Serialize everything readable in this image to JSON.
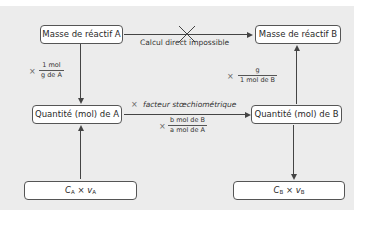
{
  "boxes": {
    "mass_a": "Masse de réactif A",
    "mass_b": "Masse de réactif B",
    "qty_a": "Quantité (mol) de A",
    "qty_b": "Quantité (mol) de B",
    "conc_a": {
      "c": "C",
      "c_sub": "A",
      "op": " × ",
      "v": "v",
      "v_sub": "A"
    },
    "conc_b": {
      "c": "C",
      "c_sub": "B",
      "op": " × ",
      "v": "v",
      "v_sub": "B"
    }
  },
  "labels": {
    "direct": "Calcul direct impossible",
    "times": "×",
    "factor": "facteur stœchiométrique",
    "frac_a_num": "1 mol",
    "frac_a_den": "g de A",
    "frac_b_num": "g",
    "frac_b_den": "1 mol de B",
    "frac_mid_num": "b mol de B",
    "frac_mid_den": "a mol de A"
  },
  "colors": {
    "panel": "#ececec",
    "box": "#ffffff",
    "stroke": "#444444"
  }
}
